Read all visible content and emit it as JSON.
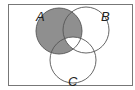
{
  "diagram": {
    "type": "venn",
    "sets": [
      {
        "label": "A",
        "cx": 59,
        "cy": 31,
        "r": 23
      },
      {
        "label": "B",
        "cx": 86,
        "cy": 30,
        "r": 23
      },
      {
        "label": "C",
        "cx": 73,
        "cy": 60,
        "r": 23
      }
    ],
    "shaded_region": "A minus (A ∩ B ∩ C)",
    "colors": {
      "shade": "#8f8f8f",
      "stroke": "#555555",
      "frame": "#777777",
      "background": "#ffffff"
    }
  }
}
